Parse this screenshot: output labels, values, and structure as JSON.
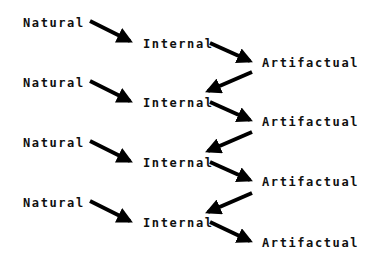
{
  "diagram": {
    "type": "flow",
    "colors": {
      "text": "#111111",
      "arrow": "#000000",
      "background": "#ffffff"
    },
    "rows": [
      {
        "natural": "Natural",
        "internal": "Internal",
        "artifactual": "Artifactual"
      },
      {
        "natural": "Natural",
        "internal": "Internal",
        "artifactual": "Artifactual"
      },
      {
        "natural": "Natural",
        "internal": "Internal",
        "artifactual": "Artifactual"
      },
      {
        "natural": "Natural",
        "internal": "Internal",
        "artifactual": "Artifactual"
      }
    ],
    "edges": [
      {
        "from": "Natural",
        "to": "Internal",
        "row": 1
      },
      {
        "from": "Internal",
        "to": "Artifactual",
        "row": 1
      },
      {
        "from": "Artifactual",
        "to": "Internal",
        "row": "1->2"
      },
      {
        "from": "Natural",
        "to": "Internal",
        "row": 2
      },
      {
        "from": "Internal",
        "to": "Artifactual",
        "row": 2
      },
      {
        "from": "Artifactual",
        "to": "Internal",
        "row": "2->3"
      },
      {
        "from": "Natural",
        "to": "Internal",
        "row": 3
      },
      {
        "from": "Internal",
        "to": "Artifactual",
        "row": 3
      },
      {
        "from": "Artifactual",
        "to": "Internal",
        "row": "3->4"
      },
      {
        "from": "Natural",
        "to": "Internal",
        "row": 4
      },
      {
        "from": "Internal",
        "to": "Artifactual",
        "row": 4
      }
    ]
  }
}
